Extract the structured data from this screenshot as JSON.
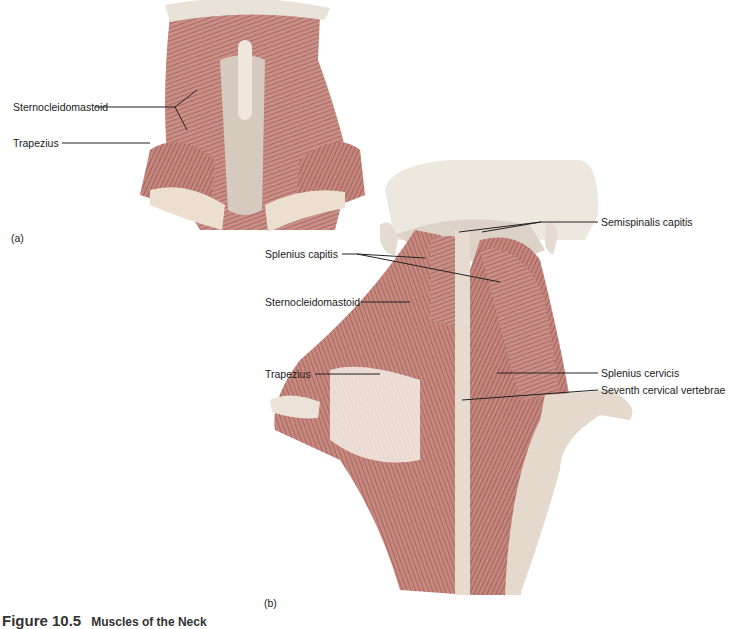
{
  "figure": {
    "panel_a": {
      "id": "(a)",
      "view": "anterior neck",
      "labels": [
        "Sternocleidomastoid",
        "Trapezius"
      ]
    },
    "panel_b": {
      "id": "(b)",
      "view": "posterior neck and upper back",
      "labels": [
        "Semispinalis capitis",
        "Splenius capitis",
        "Sternocleidomastoid",
        "Trapezius",
        "Splenius cervicis",
        "Seventh cervical vertebrae"
      ]
    },
    "caption": {
      "number": "Figure 10.5",
      "title": "Muscles of the Neck"
    }
  }
}
